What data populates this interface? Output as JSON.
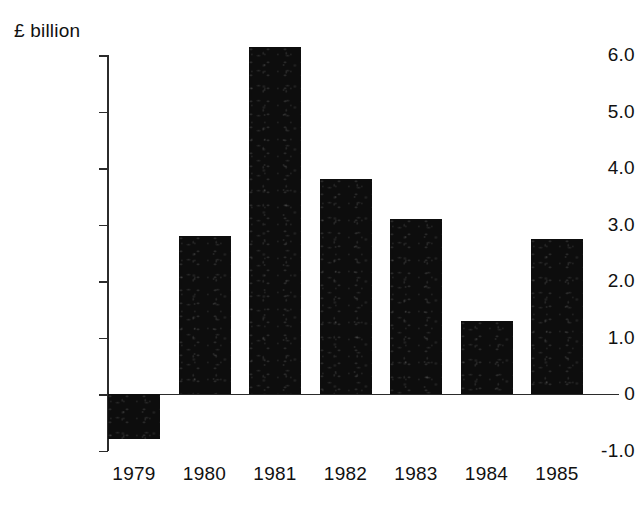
{
  "chart_data": {
    "type": "bar",
    "title": "",
    "subtitle": "",
    "xlabel": "",
    "ylabel": "£ billion",
    "categories": [
      "1979",
      "1980",
      "1981",
      "1982",
      "1983",
      "1984",
      "1985"
    ],
    "values": [
      -0.8,
      2.8,
      6.15,
      3.8,
      3.1,
      1.3,
      2.75
    ],
    "series": [
      {
        "name": "",
        "values": [
          -0.8,
          2.8,
          6.15,
          3.8,
          3.1,
          1.3,
          2.75
        ]
      }
    ],
    "ylim": [
      -1.0,
      6.0
    ],
    "ytick_labels": [
      "6.0",
      "5.0",
      "4.0",
      "3.0",
      "2.0",
      "1.0",
      "0",
      "-1.0"
    ],
    "ytick_values": [
      6.0,
      5.0,
      4.0,
      3.0,
      2.0,
      1.0,
      0,
      -1.0
    ],
    "grid": false,
    "legend": null,
    "bar_color": "#0d0d0d",
    "axis_color": "#2b2b2b",
    "background_color": "#ffffff"
  },
  "axis": {
    "unit_label": "£ billion",
    "ticks": [
      {
        "label": "6.0",
        "value": 6.0
      },
      {
        "label": "5.0",
        "value": 5.0
      },
      {
        "label": "4.0",
        "value": 4.0
      },
      {
        "label": "3.0",
        "value": 3.0
      },
      {
        "label": "2.0",
        "value": 2.0
      },
      {
        "label": "1.0",
        "value": 1.0
      },
      {
        "label": "0",
        "value": 0
      },
      {
        "label": "-1.0",
        "value": -1.0
      }
    ]
  },
  "bars": [
    {
      "category": "1979",
      "value": -0.8
    },
    {
      "category": "1980",
      "value": 2.8
    },
    {
      "category": "1981",
      "value": 6.15
    },
    {
      "category": "1982",
      "value": 3.8
    },
    {
      "category": "1983",
      "value": 3.1
    },
    {
      "category": "1984",
      "value": 1.3
    },
    {
      "category": "1985",
      "value": 2.75
    }
  ]
}
